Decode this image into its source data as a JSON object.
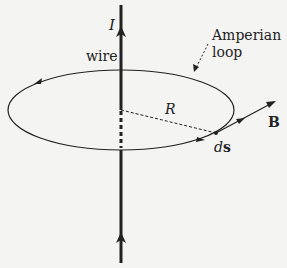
{
  "diagram": {
    "type": "physics-ampere-law",
    "labels": {
      "current": "I",
      "wire": "wire",
      "amperian_line1": "Amperian",
      "amperian_line2": "loop",
      "radius": "R",
      "field": "B",
      "ds_d": "d",
      "ds_s": "s"
    },
    "colors": {
      "ink": "#222222",
      "background": "#f4f4f2"
    }
  }
}
